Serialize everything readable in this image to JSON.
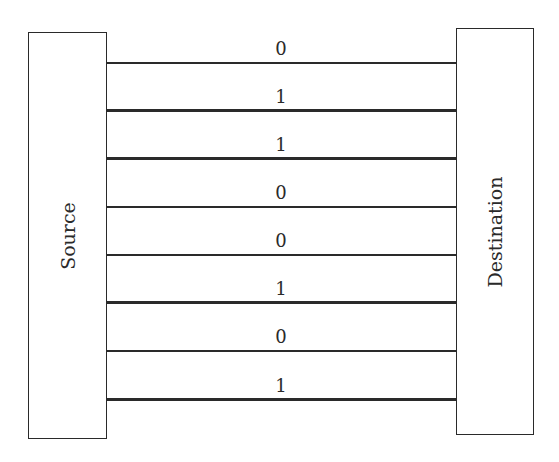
{
  "diagram": {
    "type": "parallel-transmission",
    "source": {
      "label": "Source"
    },
    "destination": {
      "label": "Destination"
    },
    "wires": [
      {
        "bit": "0",
        "y": 63
      },
      {
        "bit": "1",
        "y": 110
      },
      {
        "bit": "1",
        "y": 158
      },
      {
        "bit": "0",
        "y": 207
      },
      {
        "bit": "0",
        "y": 255
      },
      {
        "bit": "1",
        "y": 302
      },
      {
        "bit": "0",
        "y": 351
      },
      {
        "bit": "1",
        "y": 399
      }
    ]
  }
}
